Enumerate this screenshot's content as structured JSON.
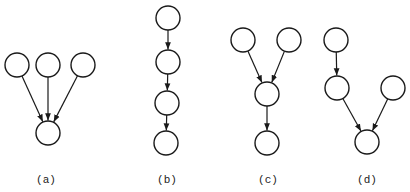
{
  "figure": {
    "subfigures": [
      {
        "id": "a",
        "label": "(a)",
        "label_pos": [
          46,
          183
        ],
        "nodes": [
          [
            17,
            65
          ],
          [
            48,
            65
          ],
          [
            83,
            65
          ],
          [
            48,
            133
          ]
        ],
        "edges": [
          [
            0,
            3
          ],
          [
            1,
            3
          ],
          [
            2,
            3
          ]
        ]
      },
      {
        "id": "b",
        "label": "(b)",
        "label_pos": [
          167,
          183
        ],
        "nodes": [
          [
            168,
            18
          ],
          [
            168,
            62
          ],
          [
            167,
            103
          ],
          [
            166,
            143
          ]
        ],
        "edges": [
          [
            0,
            1
          ],
          [
            1,
            2
          ],
          [
            2,
            3
          ]
        ]
      },
      {
        "id": "c",
        "label": "(c)",
        "label_pos": [
          268,
          183
        ],
        "nodes": [
          [
            243,
            40
          ],
          [
            289,
            40
          ],
          [
            267,
            94
          ],
          [
            267,
            143
          ]
        ],
        "edges": [
          [
            0,
            2
          ],
          [
            1,
            2
          ],
          [
            2,
            3
          ]
        ]
      },
      {
        "id": "d",
        "label": "(d)",
        "label_pos": [
          367,
          183
        ],
        "nodes": [
          [
            336,
            40
          ],
          [
            337,
            88
          ],
          [
            393,
            88
          ],
          [
            367,
            142
          ]
        ],
        "edges": [
          [
            0,
            1
          ],
          [
            1,
            3
          ],
          [
            2,
            3
          ]
        ]
      }
    ],
    "node_radius": 12,
    "colors": {
      "stroke": "#1a1a1a",
      "fill": "#ffffff"
    }
  }
}
